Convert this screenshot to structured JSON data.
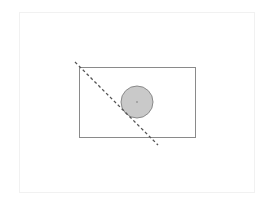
{
  "diagram": {
    "type": "geometry",
    "canvas": {
      "width": 268,
      "height": 199,
      "background": "#ffffff"
    },
    "frame": {
      "x": 19,
      "y": 12,
      "width": 236,
      "height": 181,
      "stroke": "#f1f1f1"
    },
    "rectangle": {
      "x": 79,
      "y": 67,
      "width": 116,
      "height": 70,
      "stroke": "#8a8a8a",
      "fill": "none",
      "stroke_width": 1
    },
    "circle": {
      "cx": 137,
      "cy": 102,
      "r": 16,
      "fill": "#c9c9c9",
      "stroke": "#8a8a8a",
      "stroke_width": 1
    },
    "center_point": {
      "cx": 137,
      "cy": 102,
      "r": 0.8,
      "fill": "#777777"
    },
    "dashed_line": {
      "x1": 75,
      "y1": 62,
      "x2": 158,
      "y2": 145,
      "stroke": "#555555",
      "stroke_width": 1.3,
      "dash": "3,2.5"
    }
  }
}
